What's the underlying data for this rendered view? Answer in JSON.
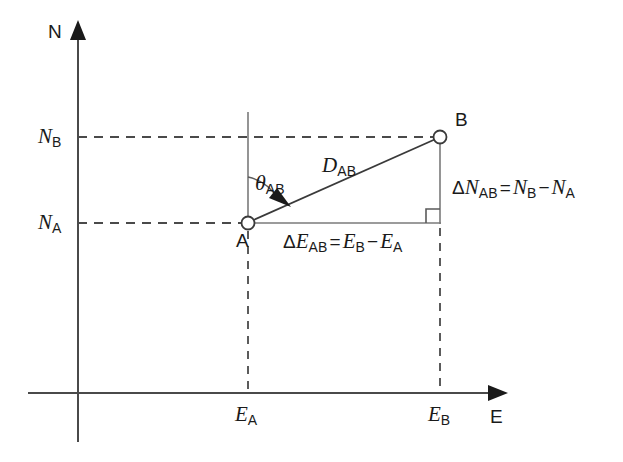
{
  "figure": {
    "background_color": "#ffffff",
    "line_color": "#3a3a3a",
    "text_color": "#1a1a1a",
    "axes": {
      "vertical_label": "N",
      "horizontal_label": "E",
      "vertical_axis_name": "north-axis",
      "horizontal_axis_name": "east-axis"
    },
    "tick_labels": {
      "n_b": {
        "symbol": "N",
        "subscript": "B"
      },
      "n_a": {
        "symbol": "N",
        "subscript": "A"
      },
      "e_a": {
        "symbol": "E",
        "subscript": "A"
      },
      "e_b": {
        "symbol": "E",
        "subscript": "B"
      }
    },
    "points": [
      {
        "id": "A",
        "label": "A",
        "marker": "open-circle",
        "x": 248,
        "y": 223
      },
      {
        "id": "B",
        "label": "B",
        "marker": "open-circle",
        "x": 440,
        "y": 137
      }
    ],
    "annotations": {
      "distance": {
        "symbol": "D",
        "subscript": "AB",
        "full": "D_AB"
      },
      "bearing": {
        "symbol": "θ",
        "subscript": "AB",
        "full": "θ_AB"
      },
      "delta_north": {
        "lhs_delta": "Δ",
        "lhs_symbol": "N",
        "lhs_subscript": "AB",
        "equals": "=",
        "rhs1_symbol": "N",
        "rhs1_subscript": "B",
        "minus": "−",
        "rhs2_symbol": "N",
        "rhs2_subscript": "A",
        "full": "ΔN_AB = N_B − N_A"
      },
      "delta_east": {
        "lhs_delta": "Δ",
        "lhs_symbol": "E",
        "lhs_subscript": "AB",
        "equals": "=",
        "rhs1_symbol": "E",
        "rhs1_subscript": "B",
        "minus": "−",
        "rhs2_symbol": "E",
        "rhs2_subscript": "A",
        "full": "ΔE_AB = E_B − E_A"
      },
      "right_angle": "right-angle-marker"
    }
  }
}
